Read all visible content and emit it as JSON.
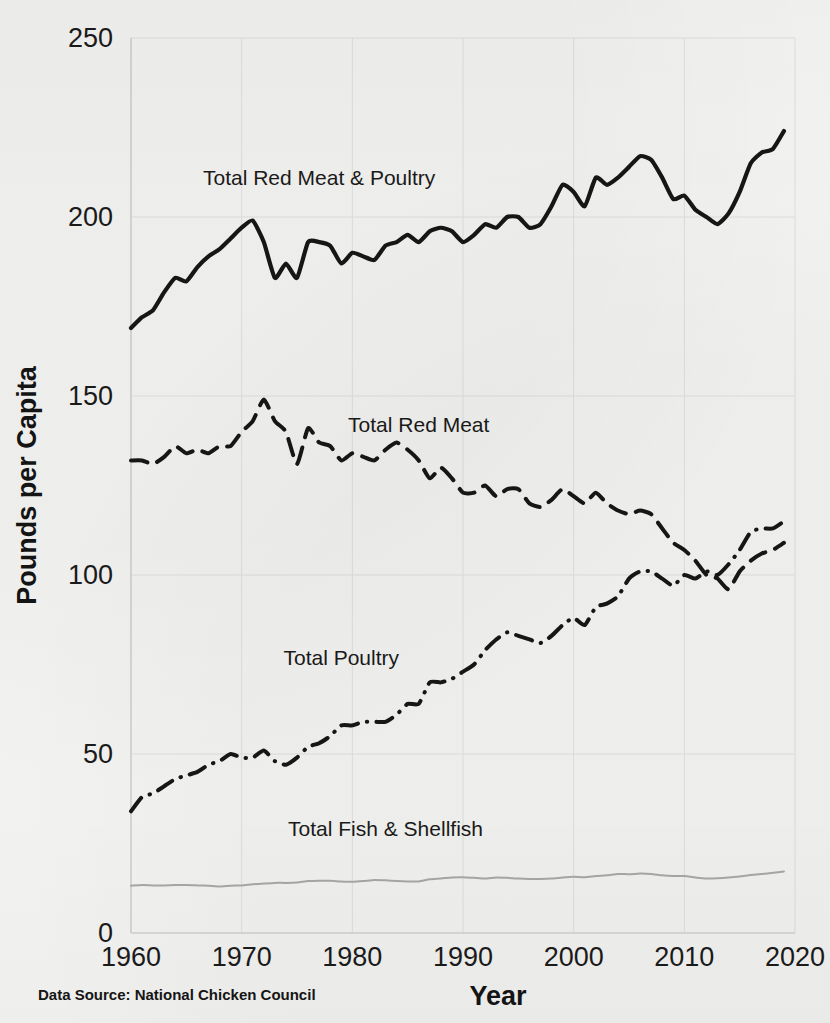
{
  "chart_data": {
    "type": "line",
    "title": "",
    "xlabel": "Year",
    "ylabel": "Pounds per Capita",
    "xlim": [
      1960,
      2020
    ],
    "ylim": [
      0,
      250
    ],
    "xticks": [
      "1960",
      "1970",
      "1980",
      "1990",
      "2000",
      "2010",
      "2020"
    ],
    "yticks": [
      "0",
      "50",
      "100",
      "150",
      "200",
      "250"
    ],
    "grid": true,
    "legend_position": "inline-labels",
    "source_note": "Data Source: National Chicken Council",
    "x": [
      1960,
      1961,
      1962,
      1963,
      1964,
      1965,
      1966,
      1967,
      1968,
      1969,
      1970,
      1971,
      1972,
      1973,
      1974,
      1975,
      1976,
      1977,
      1978,
      1979,
      1980,
      1981,
      1982,
      1983,
      1984,
      1985,
      1986,
      1987,
      1988,
      1989,
      1990,
      1991,
      1992,
      1993,
      1994,
      1995,
      1996,
      1997,
      1998,
      1999,
      2000,
      2001,
      2002,
      2003,
      2004,
      2005,
      2006,
      2007,
      2008,
      2009,
      2010,
      2011,
      2012,
      2013,
      2014,
      2015,
      2016,
      2017,
      2018,
      2019
    ],
    "series": [
      {
        "name": "Total Red Meat & Poultry",
        "style": "solid",
        "color": "#161616",
        "width": 4.2,
        "label_x": 1977,
        "label_y": 209,
        "values": [
          169,
          172,
          174,
          179,
          183,
          182,
          186,
          189,
          191,
          194,
          197,
          199,
          193,
          183,
          187,
          183,
          193,
          193,
          192,
          187,
          190,
          189,
          188,
          192,
          193,
          195,
          193,
          196,
          197,
          196,
          193,
          195,
          198,
          197,
          200,
          200,
          197,
          198,
          203,
          209,
          207,
          203,
          211,
          209,
          211,
          214,
          217,
          216,
          211,
          205,
          206,
          202,
          200,
          198,
          201,
          207,
          215,
          218,
          219,
          224
        ]
      },
      {
        "name": "Total Red Meat",
        "style": "dashed",
        "color": "#161616",
        "width": 4.0,
        "label_x": 1986,
        "label_y": 140,
        "values": [
          132,
          132,
          131,
          133,
          136,
          134,
          135,
          134,
          136,
          136,
          140,
          143,
          149,
          143,
          140,
          131,
          141,
          137,
          136,
          132,
          134,
          133,
          132,
          135,
          137,
          135,
          132,
          127,
          130,
          127,
          123,
          123,
          125,
          122,
          124,
          124,
          120,
          119,
          121,
          124,
          122,
          120,
          123,
          120,
          118,
          117,
          118,
          117,
          113,
          109,
          107,
          104,
          100,
          99,
          96,
          101,
          104,
          106,
          107,
          109
        ]
      },
      {
        "name": "Total Poultry",
        "style": "dashdot",
        "color": "#161616",
        "width": 4.0,
        "label_x": 1979,
        "label_y": 75,
        "values": [
          34,
          38,
          39,
          41,
          43,
          44,
          45,
          47,
          48,
          50,
          49,
          49,
          51,
          48,
          47,
          49,
          52,
          53,
          55,
          58,
          58,
          59,
          59,
          59,
          61,
          64,
          64,
          70,
          70,
          71,
          73,
          75,
          79,
          82,
          84,
          83,
          82,
          81,
          83,
          86,
          88,
          86,
          91,
          92,
          94,
          99,
          101,
          101,
          99,
          97,
          100,
          99,
          101,
          100,
          103,
          107,
          112,
          113,
          113,
          115
        ]
      },
      {
        "name": "Total Fish & Shellfish",
        "style": "thin-solid",
        "color": "#a8a8a8",
        "width": 2.0,
        "label_x": 1983,
        "label_y": 27,
        "values": [
          13.2,
          13.4,
          13.3,
          13.3,
          13.4,
          13.4,
          13.3,
          13.2,
          13.0,
          13.2,
          13.3,
          13.6,
          13.8,
          14.0,
          14.0,
          14.1,
          14.5,
          14.6,
          14.6,
          14.4,
          14.3,
          14.5,
          14.8,
          14.7,
          14.5,
          14.4,
          14.4,
          15.0,
          15.2,
          15.5,
          15.6,
          15.4,
          15.2,
          15.5,
          15.4,
          15.2,
          15.1,
          15.1,
          15.2,
          15.5,
          15.7,
          15.6,
          15.9,
          16.1,
          16.5,
          16.4,
          16.6,
          16.5,
          16.1,
          15.9,
          15.9,
          15.5,
          15.2,
          15.3,
          15.5,
          15.8,
          16.2,
          16.5,
          16.8,
          17.2
        ]
      }
    ]
  }
}
